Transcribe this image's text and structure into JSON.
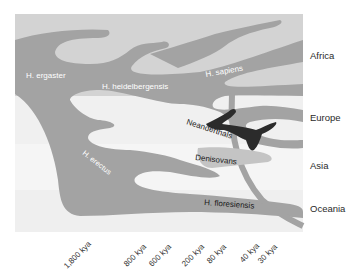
{
  "diagram": {
    "type": "hominin-phylogeny-migration",
    "colors": {
      "africa_band": "#d3d3d3",
      "europe_band": "#f0f0f0",
      "asia_band": "#f4f4f4",
      "oceania_band": "#f0f0f0",
      "lineage": "#a0a0a0",
      "lineage_light": "#b8b8b8",
      "neanderthal": "#2b2b2b",
      "denisovan": "#c4c4c4"
    },
    "regions": [
      {
        "label": "Africa"
      },
      {
        "label": "Europe"
      },
      {
        "label": "Asia"
      },
      {
        "label": "Oceania"
      }
    ],
    "species": {
      "ergaster": "H. ergaster",
      "heidelbergensis": "H. heidelbergensis",
      "sapiens": "H. sapiens",
      "erectus": "H. erectus",
      "neanderthals": "Neanderthals",
      "denisovans": "Denisovans",
      "floresiensis": "H. floresiensis"
    },
    "time_axis": [
      {
        "label": "1,800 kya"
      },
      {
        "label": "800 kya"
      },
      {
        "label": "600 kya"
      },
      {
        "label": "200 kya"
      },
      {
        "label": "80 kya"
      },
      {
        "label": "40 kya"
      },
      {
        "label": "30 kya"
      }
    ]
  }
}
